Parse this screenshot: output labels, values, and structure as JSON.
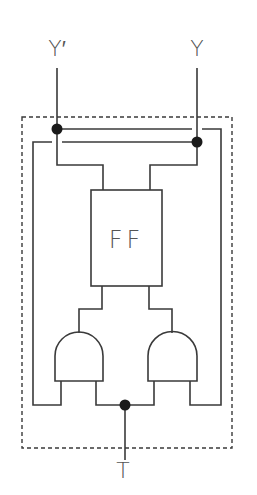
{
  "diagram": {
    "type": "logic-circuit",
    "labels": {
      "output_inverted": "Y′",
      "output": "Y",
      "flipflop": "FF",
      "input": "T"
    },
    "components": [
      {
        "name": "flip-flop",
        "label": "FF"
      },
      {
        "name": "and-gate-left",
        "label": ""
      },
      {
        "name": "and-gate-right",
        "label": ""
      }
    ],
    "junctions": [
      "Y'",
      "Y",
      "T"
    ],
    "colors": {
      "line": "#3a3a3a",
      "dot": "#1a1a1a",
      "text": "#555555",
      "background": "#ffffff"
    }
  }
}
